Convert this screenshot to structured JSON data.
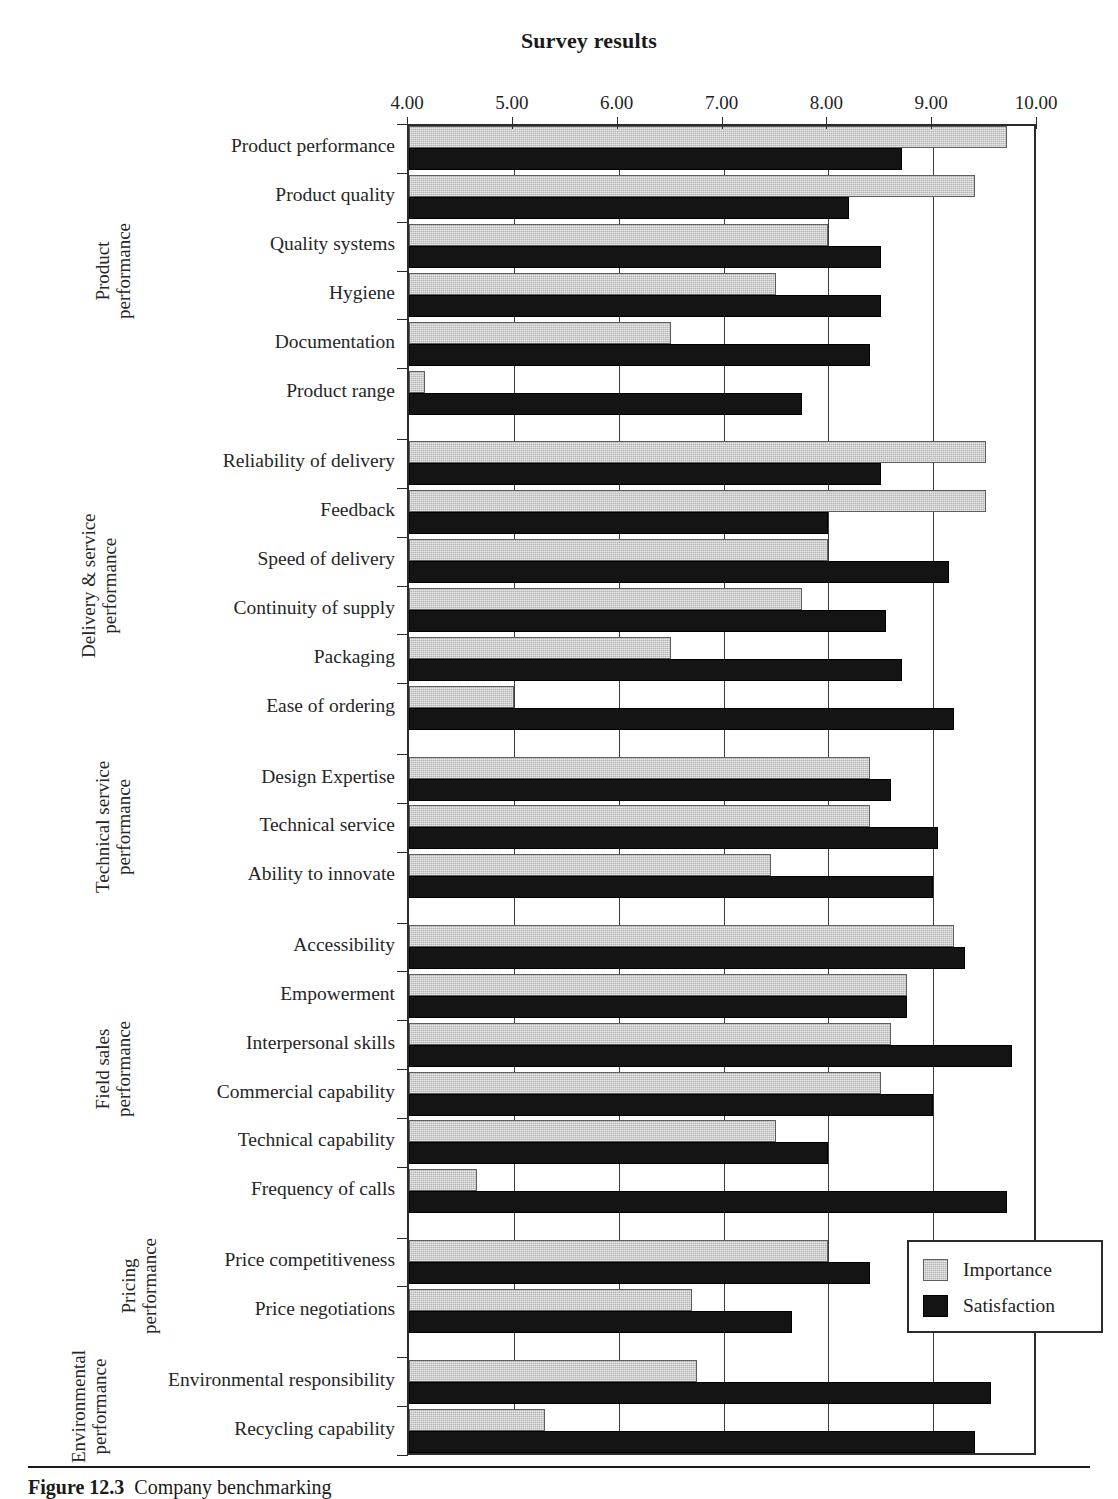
{
  "chart_data": {
    "type": "bar",
    "orientation": "horizontal",
    "title": "Survey results",
    "xlabel": "",
    "ylabel": "",
    "xlim": [
      4.0,
      10.0
    ],
    "xticks": [
      "4.00",
      "5.00",
      "6.00",
      "7.00",
      "8.00",
      "9.00",
      "10.00"
    ],
    "grid": true,
    "legend_position": "bottom-right",
    "series": [
      {
        "name": "Importance",
        "color": "#b5b5b5",
        "values": [
          9.7,
          9.4,
          8.0,
          7.5,
          6.5,
          4.15,
          9.5,
          9.5,
          8.0,
          7.75,
          6.5,
          5.0,
          8.4,
          8.4,
          7.45,
          9.2,
          8.75,
          8.6,
          8.5,
          7.5,
          4.65,
          8.0,
          6.7,
          6.75,
          5.3
        ]
      },
      {
        "name": "Satisfaction",
        "color": "#141414",
        "values": [
          8.7,
          8.2,
          8.5,
          8.5,
          8.4,
          7.75,
          8.5,
          8.0,
          9.15,
          8.55,
          8.7,
          9.2,
          8.6,
          9.05,
          9.0,
          9.3,
          8.75,
          9.75,
          9.0,
          8.0,
          9.7,
          8.4,
          7.65,
          9.55,
          9.4
        ]
      }
    ],
    "categories": [
      "Product performance",
      "Product quality",
      "Quality systems",
      "Hygiene",
      "Documentation",
      "Product range",
      "Reliability of delivery",
      "Feedback",
      "Speed of delivery",
      "Continuity of supply",
      "Packaging",
      "Ease of ordering",
      "Design Expertise",
      "Technical service",
      "Ability to innovate",
      "Accessibility",
      "Empowerment",
      "Interpersonal skills",
      "Commercial capability",
      "Technical capability",
      "Frequency of calls",
      "Price competitiveness",
      "Price negotiations",
      "Environmental responsibility",
      "Recycling capability"
    ],
    "groups": [
      {
        "label": "Product performance",
        "label_lines": [
          "Product",
          "performance"
        ],
        "start": 0,
        "count": 6
      },
      {
        "label": "Delivery & service performance",
        "label_lines": [
          "Delivery & service",
          "performance"
        ],
        "start": 6,
        "count": 6
      },
      {
        "label": "Technical service performance",
        "label_lines": [
          "Technical service",
          "performance"
        ],
        "start": 12,
        "count": 3
      },
      {
        "label": "Field sales performance",
        "label_lines": [
          "Field sales",
          "performance"
        ],
        "start": 15,
        "count": 6
      },
      {
        "label": "Pricing performance",
        "label_lines": [
          "Pricing",
          "performance"
        ],
        "start": 21,
        "count": 2
      },
      {
        "label": "Environmental performance",
        "label_lines": [
          "Environmental",
          "performance"
        ],
        "start": 23,
        "count": 2
      }
    ]
  },
  "legend": {
    "items": [
      {
        "label": "Importance",
        "swatch": "imp"
      },
      {
        "label": "Satisfaction",
        "swatch": "sat"
      }
    ]
  },
  "caption": {
    "figure_number": "Figure 12.3",
    "text": "Company benchmarking"
  }
}
